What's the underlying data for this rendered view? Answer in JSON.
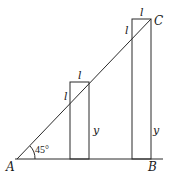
{
  "diagram": {
    "type": "geometry",
    "points": {
      "A": "A",
      "B": "B",
      "C": "C"
    },
    "angle_label": "45°",
    "small_rect": {
      "top_label": "l",
      "side_label": "l",
      "height_label": "y"
    },
    "large_rect": {
      "top_label": "l",
      "side_label": "l",
      "height_label": "y"
    },
    "colors": {
      "stroke": "#2a2a2a",
      "background": "#ffffff"
    }
  }
}
